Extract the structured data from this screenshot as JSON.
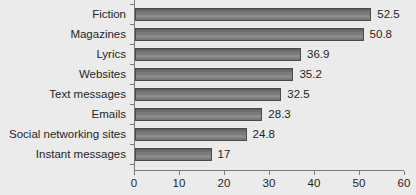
{
  "chart_data": {
    "type": "bar",
    "orientation": "horizontal",
    "title": "",
    "subtitle": "",
    "xlabel": "",
    "ylabel": "",
    "xlim": [
      0,
      60
    ],
    "xticks": [
      0,
      10,
      20,
      30,
      40,
      50,
      60
    ],
    "grid": false,
    "legend": null,
    "bar_color": "#7b7b7b",
    "bar_edge_color": "#4a4a4a",
    "background_color": "#ebebeb",
    "axis_color": "#7a7a7a",
    "text_color": "#262626",
    "show_value_labels": true,
    "categories": [
      "Fiction",
      "Magazines",
      "Lyrics",
      "Websites",
      "Text messages",
      "Emails",
      "Social networking sites",
      "Instant messages"
    ],
    "values": [
      52.5,
      50.8,
      36.9,
      35.2,
      32.5,
      28.3,
      24.8,
      17
    ],
    "value_labels": [
      "52.5",
      "50.8",
      "36.9",
      "35.2",
      "32.5",
      "28.3",
      "24.8",
      "17"
    ],
    "tick_labels": [
      "0",
      "10",
      "20",
      "30",
      "40",
      "50",
      "60"
    ]
  }
}
